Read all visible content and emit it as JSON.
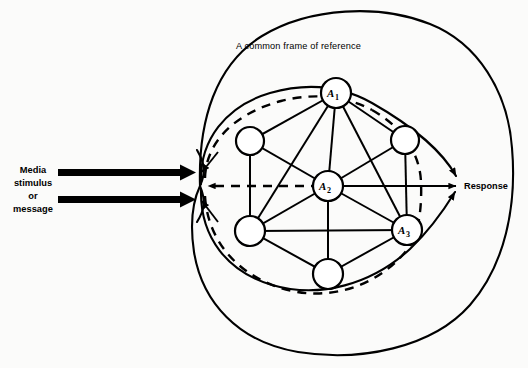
{
  "diagram": {
    "title_caption": "A common frame of reference",
    "input_label_lines": [
      "Media",
      "stimulus",
      "or",
      "message"
    ],
    "output_label": "Response",
    "nodes": [
      {
        "id": "A1",
        "label": "A",
        "subscript": "1",
        "cx": 336,
        "cy": 93,
        "r": 15,
        "labeled": true
      },
      {
        "id": "A2",
        "label": "A",
        "subscript": "2",
        "cx": 328,
        "cy": 186,
        "r": 15,
        "labeled": true
      },
      {
        "id": "A3",
        "label": "A",
        "subscript": "3",
        "cx": 407,
        "cy": 230,
        "r": 15,
        "labeled": true
      },
      {
        "id": "N4",
        "label": "",
        "subscript": "",
        "cx": 250,
        "cy": 141,
        "r": 14,
        "labeled": false
      },
      {
        "id": "N5",
        "label": "",
        "subscript": "",
        "cx": 405,
        "cy": 140,
        "r": 14,
        "labeled": false
      },
      {
        "id": "N6",
        "label": "",
        "subscript": "",
        "cx": 250,
        "cy": 231,
        "r": 15,
        "labeled": false
      },
      {
        "id": "N7",
        "label": "",
        "subscript": "",
        "cx": 328,
        "cy": 274,
        "r": 15,
        "labeled": false
      }
    ],
    "edges": [
      [
        "A1",
        "N4"
      ],
      [
        "A1",
        "N5"
      ],
      [
        "A1",
        "A2"
      ],
      [
        "A1",
        "N6"
      ],
      [
        "A1",
        "A3"
      ],
      [
        "N4",
        "A2"
      ],
      [
        "N4",
        "N6"
      ],
      [
        "N5",
        "A2"
      ],
      [
        "N5",
        "A3"
      ],
      [
        "A2",
        "N6"
      ],
      [
        "A2",
        "A3"
      ],
      [
        "A2",
        "N7"
      ],
      [
        "N6",
        "N7"
      ],
      [
        "N6",
        "A3"
      ],
      [
        "N7",
        "A3"
      ]
    ],
    "boundary_names": {
      "outer": "common-frame-of-reference-boundary",
      "inner_solid": "group-boundary",
      "inner_dashed": "feedback-boundary"
    },
    "colors": {
      "ink": "#000000",
      "paper": "#fbfbfa"
    }
  }
}
